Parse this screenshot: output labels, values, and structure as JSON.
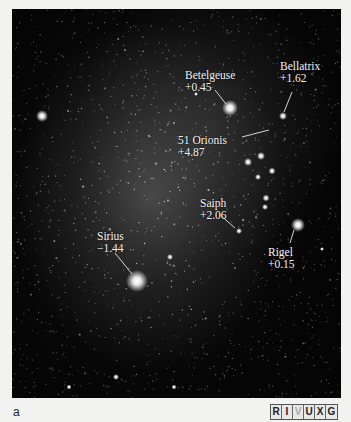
{
  "figure": {
    "panel_letter": "a",
    "wavelength_bands": [
      {
        "letter": "R",
        "active": true
      },
      {
        "letter": "I",
        "active": true
      },
      {
        "letter": "V",
        "active": false
      },
      {
        "letter": "U",
        "active": true
      },
      {
        "letter": "X",
        "active": true
      },
      {
        "letter": "G",
        "active": true
      }
    ]
  },
  "stars": [
    {
      "name": "Betelgeuse",
      "magnitude": "+0.45"
    },
    {
      "name": "Bellatrix",
      "magnitude": "+1.62"
    },
    {
      "name": "51 Orionis",
      "magnitude": "+4.87"
    },
    {
      "name": "Saiph",
      "magnitude": "+2.06"
    },
    {
      "name": "Rigel",
      "magnitude": "+0.15"
    },
    {
      "name": "Sirius",
      "magnitude": "−1.44"
    }
  ]
}
